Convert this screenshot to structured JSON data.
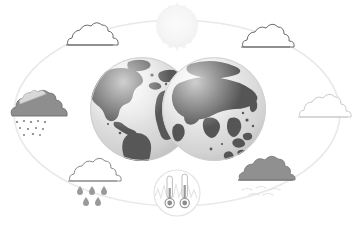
{
  "illustration": {
    "title": "Global Weather and Climate Illustration",
    "background_color": "#ffffff",
    "canvas": {
      "width": 354,
      "height": 228
    }
  },
  "orbit": {
    "name": "orbit-ellipse",
    "center_x": 177,
    "center_y": 113,
    "radius_x": 163,
    "radius_y": 93,
    "stroke_color": "#e9e9e9",
    "stroke_width": 1.6
  },
  "sun": {
    "label": "sun",
    "center_x": 177,
    "center_y": 25,
    "radius": 22,
    "ray_count": 28,
    "core_color": "#f7f7f7",
    "ray_color": "#f2f2f2"
  },
  "globes": [
    {
      "label": "globe-western-hemisphere",
      "center_x": 142,
      "center_y": 109,
      "radius": 52,
      "ocean_color": "#d0d0d0",
      "land_color": "#5a5a5a",
      "highlight_color": "#efefef"
    },
    {
      "label": "globe-eastern-hemisphere",
      "center_x": 214,
      "center_y": 109,
      "radius": 52,
      "ocean_color": "#d6d6d6",
      "land_color": "#555555",
      "highlight_color": "#f1f1f1"
    }
  ],
  "weather_icons": [
    {
      "id": "cloud-top-left",
      "label": "Cloud",
      "type": "cloud-outline",
      "x": 87,
      "y": 39,
      "fill": "#ffffff",
      "stroke": "#5f5f5f",
      "precipitation": "none"
    },
    {
      "id": "cloud-top-right",
      "label": "Cloud",
      "type": "cloud-outline",
      "x": 264,
      "y": 41,
      "fill": "#ffffff",
      "stroke": "#5f5f5f",
      "precipitation": "none"
    },
    {
      "id": "cloud-left-snow",
      "label": "Snow shower",
      "type": "cloud-filled",
      "x": 32,
      "y": 109,
      "fill": "#8c8c8c",
      "stroke": "#6a6a6a",
      "precipitation": "snow"
    },
    {
      "id": "cloud-right",
      "label": "Cloud",
      "type": "cloud-outline",
      "x": 318,
      "y": 110,
      "fill": "#ffffff",
      "stroke": "#cfcfcf",
      "precipitation": "none"
    },
    {
      "id": "cloud-bottom-left-rain",
      "label": "Rain shower",
      "type": "cloud-outline",
      "x": 89,
      "y": 174,
      "fill": "#ffffff",
      "stroke": "#8a8a8a",
      "precipitation": "rain"
    },
    {
      "id": "cloud-bottom-right-wind",
      "label": "Windy cloud",
      "type": "cloud-filled",
      "x": 262,
      "y": 172,
      "fill": "#8f8f8f",
      "stroke": "#7d7d7d",
      "precipitation": "wind"
    }
  ],
  "thermometer_badge": {
    "label": "Temperature gauge",
    "center_x": 177,
    "center_y": 193,
    "radius": 24,
    "circle_stroke": "#e0e0e0",
    "circle_fill": "#ffffff",
    "chart_color": "#e2e2e2",
    "thermometers": [
      {
        "id": "thermometer-left",
        "x": 170,
        "level": 0.34,
        "tube_color": "#bdbdbd",
        "bulb_color": "#8d8d8d"
      },
      {
        "id": "thermometer-right",
        "x": 185,
        "level": 0.52,
        "tube_color": "#bdbdbd",
        "bulb_color": "#8d8d8d"
      }
    ]
  },
  "palette": {
    "orbit": "#e9e9e9",
    "land_dark": "#575757",
    "ocean_light": "#d2d2d2",
    "cloud_gray": "#8c8c8c",
    "cloud_outline": "#6a6a6a",
    "sun_pale": "#f5f5f5",
    "background": "#ffffff"
  }
}
